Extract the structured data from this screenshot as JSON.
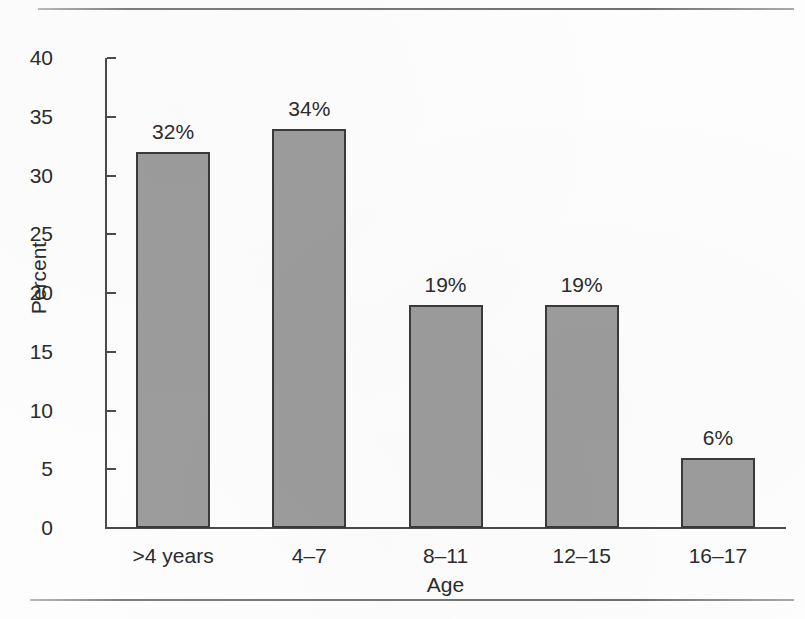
{
  "chart_data": {
    "type": "bar",
    "title": "",
    "subtitle": "",
    "xlabel": "Age",
    "ylabel": "Percent",
    "categories": [
      ">4 years",
      "4–7",
      "8–11",
      "12–15",
      "16–17"
    ],
    "values": [
      32,
      34,
      19,
      19,
      6
    ],
    "data_labels": [
      "32%",
      "34%",
      "19%",
      "19%",
      "6%"
    ],
    "ylim": [
      0,
      40
    ],
    "yticks": [
      0,
      5,
      10,
      15,
      20,
      25,
      30,
      35,
      40
    ],
    "ytick_labels": [
      "0",
      "5",
      "10",
      "15",
      "20",
      "25",
      "30",
      "35",
      "40"
    ],
    "grid": false,
    "legend": false,
    "legend_position": "none",
    "bar_fill_color": "#9c9c9c",
    "bar_edge_color": "#3a3a3a",
    "axis_color": "#4a4a4a",
    "text_color": "#2b2b2b",
    "background_color": "#fdfdfd"
  },
  "figure": {
    "top_rule": "",
    "bottom_rule": ""
  }
}
